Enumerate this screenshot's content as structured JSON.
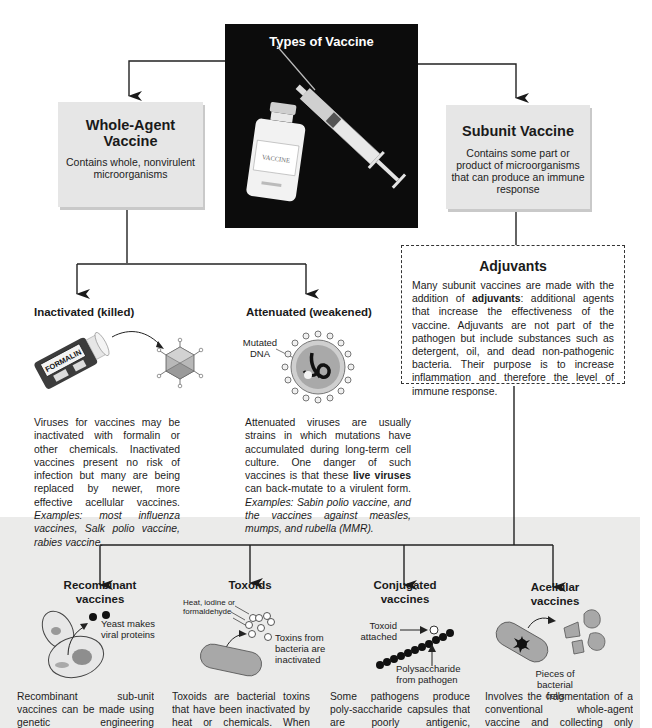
{
  "title": "Types of Vaccine",
  "hero_image": {
    "alt": "vaccine-vial-and-syringe",
    "vial_label": "VACCINE",
    "background": "#0c0c0c"
  },
  "whole_agent": {
    "title_line1": "Whole-Agent",
    "title_line2": "Vaccine",
    "desc_line1": "Contains whole, nonvirulent",
    "desc_line2": "microorganisms"
  },
  "subunit": {
    "title": "Subunit Vaccine",
    "desc_line1": "Contains some part or",
    "desc_line2": "product of microorganisms",
    "desc_line3": "that can produce an immune",
    "desc_line4": "response"
  },
  "adjuvants": {
    "title": "Adjuvants",
    "text_before": "Many subunit vaccines are made with the addition of ",
    "bold_term": "adjuvants",
    "text_after": ": additional agents that increase the effectiveness of the vaccine. Adjuvants are not part of the pathogen but include substances such as detergent, oil, and dead non-pathogenic bacteria. Their purpose is to increase inflammation and therefore the level of immune response."
  },
  "inactivated": {
    "title": "Inactivated (killed)",
    "bottle_label": "FORMALIN",
    "text": "Viruses for vaccines may be inactivated with formalin or other chemicals. Inactivated vaccines present no risk of infection but many are being replaced by newer, more effective acellular vaccines. ",
    "examples": "Examples: most influenza vaccines, Salk polio vaccine, rabies vaccine."
  },
  "attenuated": {
    "title": "Attenuated (weakened)",
    "label_line1": "Mutated",
    "label_line2": "DNA",
    "text_before": "Attenuated viruses are usually strains in which mutations have accumulated during long-term cell culture. One danger of such vaccines is that these ",
    "bold_term": "live viruses",
    "text_after": " can back-mutate to a virulent form. ",
    "examples": "Examples: Sabin polio vaccine, and the vaccines against measles, mumps, and rubella (MMR)."
  },
  "subunit_types": [
    {
      "title_line1": "Recombinant",
      "title_line2": "vaccines",
      "label_line1": "Yeast makes",
      "label_line2": "viral proteins",
      "text": "Recombinant sub-unit vaccines can be made using genetic engineering techniques, where"
    },
    {
      "title_line1": "Toxoids",
      "title_line2": "",
      "label_top_line1": "Heat, iodine or",
      "label_top_line2": "formaldehyde",
      "label_line1": "Toxins from",
      "label_line2": "bacteria are",
      "label_line3": "inactivated",
      "text": "Toxoids are bacterial toxins that have been inactivated by heat or chemicals. When injected, the"
    },
    {
      "title_line1": "Conjugated",
      "title_line2": "vaccines",
      "label_top_line1": "Toxoid",
      "label_top_line2": "attached",
      "label_line1": "Polysaccharide",
      "label_line2": "from pathogen",
      "text": "Some pathogens produce poly-saccharide capsules that are poorly antigenic, especially in"
    },
    {
      "title_line1": "Acellular",
      "title_line2": "vaccines",
      "label_line1": "Pieces of",
      "label_line2": "bacterial cells",
      "text": "Involves the fragmentation of a conventional whole-agent vaccine and collecting only those portions"
    }
  ],
  "colors": {
    "band": "#ebebea",
    "card": "#e6e6e6",
    "line": "#222222"
  }
}
